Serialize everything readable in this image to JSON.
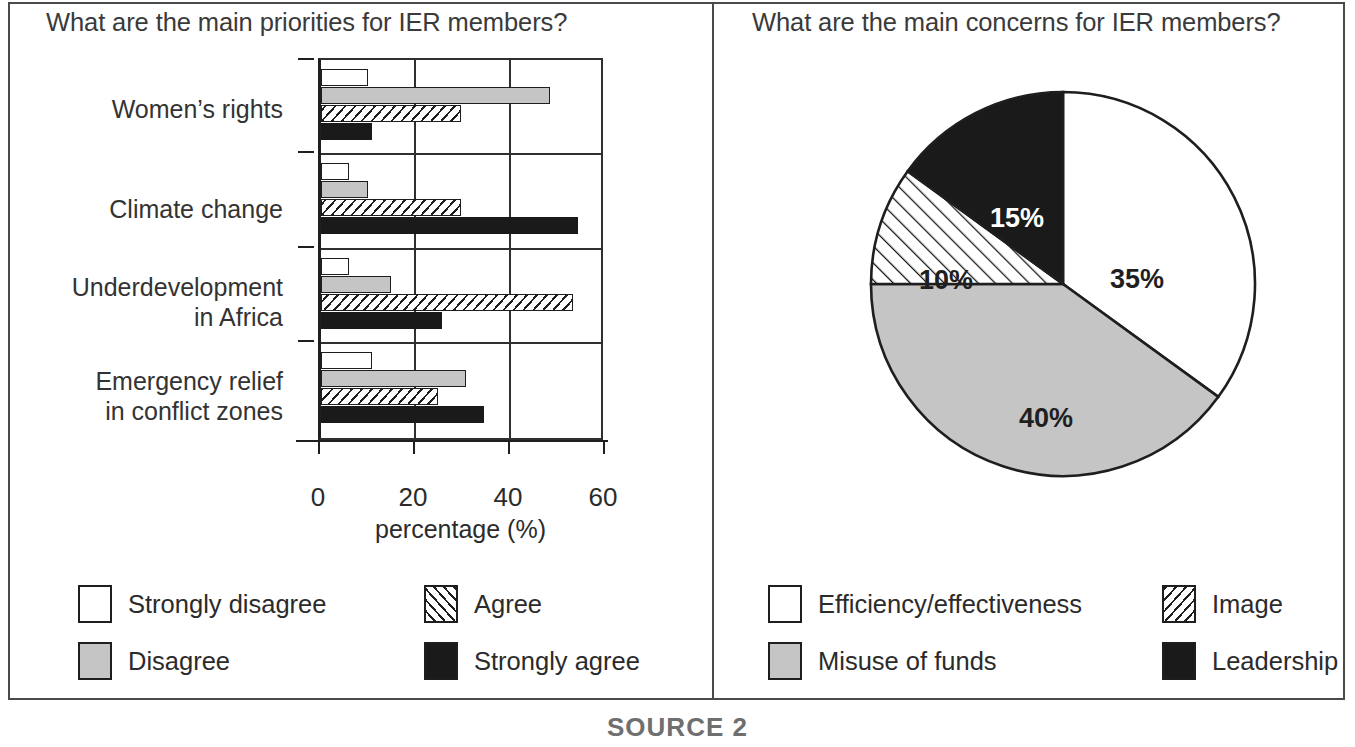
{
  "figure": {
    "source_caption": "SOURCE 2"
  },
  "bar_panel": {
    "title": "What are the main priorities for IER members?",
    "x_axis_caption": "percentage (%)",
    "x_ticks": [
      "0",
      "20",
      "40",
      "60"
    ],
    "categories": [
      "Women’s rights",
      "Climate change",
      "Underdevelopment\nin Africa",
      "Emergency relief\nin conflict zones"
    ],
    "legend": [
      {
        "label": "Strongly disagree",
        "pattern": "white"
      },
      {
        "label": "Agree",
        "pattern": "hatched"
      },
      {
        "label": "Disagree",
        "pattern": "gray"
      },
      {
        "label": "Strongly agree",
        "pattern": "black"
      }
    ]
  },
  "pie_panel": {
    "title": "What are the main concerns for IER members?",
    "legend": [
      {
        "label": "Efficiency/effectiveness",
        "pattern": "white"
      },
      {
        "label": "Image",
        "pattern": "hatched"
      },
      {
        "label": "Misuse of funds",
        "pattern": "gray"
      },
      {
        "label": "Leadership",
        "pattern": "black"
      }
    ],
    "slice_labels": [
      "35%",
      "40%",
      "10%",
      "15%"
    ]
  },
  "chart_data": [
    {
      "type": "bar",
      "orientation": "horizontal",
      "title": "What are the main priorities for IER members?",
      "xlabel": "percentage (%)",
      "ylabel": "",
      "xlim": [
        0,
        60
      ],
      "xticks": [
        0,
        20,
        40,
        60
      ],
      "grid": true,
      "legend_position": "below",
      "categories": [
        "Women’s rights",
        "Climate change",
        "Underdevelopment in Africa",
        "Emergency relief in conflict zones"
      ],
      "series": [
        {
          "name": "Strongly disagree",
          "pattern": "white",
          "values": [
            10,
            6,
            6,
            11
          ]
        },
        {
          "name": "Disagree",
          "pattern": "gray",
          "values": [
            49,
            10,
            15,
            31
          ]
        },
        {
          "name": "Agree",
          "pattern": "hatched",
          "values": [
            30,
            30,
            54,
            25
          ]
        },
        {
          "name": "Strongly agree",
          "pattern": "black",
          "values": [
            11,
            55,
            26,
            35
          ]
        }
      ]
    },
    {
      "type": "pie",
      "title": "What are the main concerns for IER members?",
      "legend_position": "below",
      "start_angle_deg": 0,
      "direction": "clockwise",
      "labels": [
        "Efficiency/effectiveness",
        "Misuse of funds",
        "Image",
        "Leadership"
      ],
      "values": [
        35,
        40,
        10,
        15
      ],
      "display_labels": [
        "35%",
        "40%",
        "10%",
        "15%"
      ],
      "patterns": [
        "white",
        "gray",
        "hatched",
        "black"
      ]
    }
  ],
  "colors": {
    "line": "#1f1f1f",
    "gray_fill": "#c5c5c5",
    "black_fill": "#1a1a1a",
    "white_fill": "#ffffff",
    "text": "#2b2b2b"
  }
}
